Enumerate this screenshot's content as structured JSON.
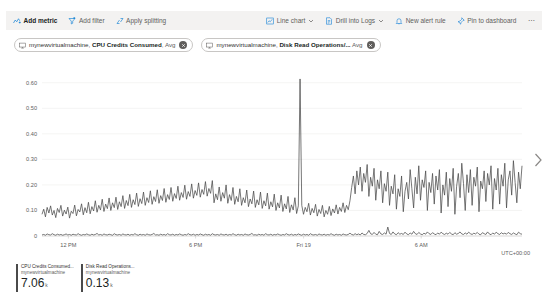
{
  "toolbar": {
    "left_items": [
      {
        "label": "Add metric",
        "icon": "add-metric-icon",
        "primary": true,
        "chevron": false
      },
      {
        "label": "Add filter",
        "icon": "add-filter-icon",
        "primary": false,
        "chevron": false
      },
      {
        "label": "Apply splitting",
        "icon": "apply-splitting-icon",
        "primary": false,
        "chevron": false
      }
    ],
    "right_items": [
      {
        "label": "Line chart",
        "icon": "line-chart-icon",
        "primary": false,
        "chevron": true
      },
      {
        "label": "Drill into Logs",
        "icon": "drill-into-logs-icon",
        "primary": false,
        "chevron": true
      },
      {
        "label": "New alert rule",
        "icon": "new-alert-rule-icon",
        "primary": false,
        "chevron": false
      },
      {
        "label": "Pin to dashboard",
        "icon": "pin-to-dashboard-icon",
        "primary": false,
        "chevron": false
      }
    ],
    "overflow_label": "⋯"
  },
  "metric_pills": [
    {
      "resource": "mynewvirtualmachine,",
      "metric": "CPU Credits Consumed",
      "separator": ",",
      "aggregation": "Avg",
      "icon": "vm-icon",
      "close_icon": "close-icon"
    },
    {
      "resource": "mynewvirtualmachine,",
      "metric": "Disk Read Operations/...",
      "separator": "",
      "aggregation": "Avg",
      "icon": "vm-icon",
      "close_icon": "close-icon"
    }
  ],
  "next_arrow_icon": "chevron-right-icon",
  "legend": [
    {
      "metric": "CPU Credits Consumed...",
      "resource": "mynewvirtualmachine",
      "value": "7.06",
      "unit": "k",
      "color": "#4a4a4a"
    },
    {
      "metric": "Disk Read Operations...",
      "resource": "mynewvirtualmachine",
      "value": "0.13",
      "unit": "k",
      "color": "#4a4a4a"
    }
  ],
  "chart_data": {
    "type": "line",
    "title": "",
    "xlabel": "",
    "ylabel": "",
    "timezone_label": "UTC+00:00",
    "grid": true,
    "legend_position": "bottom",
    "ylim": [
      0,
      0.65
    ],
    "y_ticks": [
      "0",
      "0.10",
      "0.20",
      "0.30",
      "0.40",
      "0.50",
      "0.60"
    ],
    "y_tick_values": [
      0,
      0.1,
      0.2,
      0.3,
      0.4,
      0.5,
      0.6
    ],
    "x_ticks": [
      "12 PM",
      "6 PM",
      "Fri 19",
      "6 AM"
    ],
    "x_tick_positions": [
      0.055,
      0.32,
      0.545,
      0.79
    ],
    "series": [
      {
        "name": "CPU Credits Consumed",
        "resource": "mynewvirtualmachine",
        "color": "#4a4a4a",
        "aggregation": "Avg",
        "values": [
          0.085,
          0.105,
          0.075,
          0.112,
          0.09,
          0.118,
          0.082,
          0.1,
          0.072,
          0.108,
          0.092,
          0.12,
          0.078,
          0.101,
          0.086,
          0.113,
          0.07,
          0.097,
          0.088,
          0.121,
          0.079,
          0.104,
          0.094,
          0.126,
          0.083,
          0.111,
          0.091,
          0.132,
          0.087,
          0.115,
          0.098,
          0.138,
          0.093,
          0.12,
          0.102,
          0.144,
          0.096,
          0.125,
          0.107,
          0.149,
          0.1,
          0.13,
          0.111,
          0.152,
          0.104,
          0.134,
          0.115,
          0.158,
          0.108,
          0.139,
          0.119,
          0.163,
          0.112,
          0.142,
          0.123,
          0.168,
          0.116,
          0.146,
          0.127,
          0.172,
          0.12,
          0.15,
          0.131,
          0.177,
          0.124,
          0.154,
          0.135,
          0.181,
          0.128,
          0.158,
          0.139,
          0.186,
          0.132,
          0.162,
          0.143,
          0.19,
          0.136,
          0.166,
          0.147,
          0.195,
          0.14,
          0.17,
          0.151,
          0.199,
          0.144,
          0.174,
          0.155,
          0.204,
          0.148,
          0.178,
          0.159,
          0.208,
          0.152,
          0.182,
          0.163,
          0.213,
          0.156,
          0.186,
          0.167,
          0.217,
          0.13,
          0.165,
          0.142,
          0.192,
          0.136,
          0.17,
          0.148,
          0.2,
          0.128,
          0.162,
          0.139,
          0.19,
          0.124,
          0.155,
          0.134,
          0.185,
          0.12,
          0.15,
          0.13,
          0.18,
          0.115,
          0.145,
          0.126,
          0.176,
          0.112,
          0.142,
          0.122,
          0.172,
          0.108,
          0.138,
          0.118,
          0.168,
          0.105,
          0.134,
          0.114,
          0.164,
          0.1,
          0.13,
          0.11,
          0.16,
          0.096,
          0.126,
          0.106,
          0.155,
          0.092,
          0.122,
          0.102,
          0.15,
          0.088,
          0.118,
          0.615,
          0.12,
          0.085,
          0.112,
          0.095,
          0.128,
          0.082,
          0.108,
          0.091,
          0.124,
          0.078,
          0.104,
          0.088,
          0.12,
          0.075,
          0.1,
          0.085,
          0.116,
          0.08,
          0.106,
          0.09,
          0.122,
          0.086,
          0.112,
          0.096,
          0.13,
          0.092,
          0.12,
          0.103,
          0.138,
          0.19,
          0.235,
          0.165,
          0.255,
          0.2,
          0.27,
          0.175,
          0.245,
          0.21,
          0.28,
          0.155,
          0.23,
          0.195,
          0.265,
          0.14,
          0.22,
          0.185,
          0.255,
          0.13,
          0.205,
          0.175,
          0.25,
          0.12,
          0.195,
          0.165,
          0.24,
          0.105,
          0.185,
          0.155,
          0.235,
          0.095,
          0.175,
          0.21,
          0.145,
          0.26,
          0.185,
          0.11,
          0.23,
          0.165,
          0.275,
          0.14,
          0.22,
          0.19,
          0.255,
          0.1,
          0.21,
          0.17,
          0.245,
          0.125,
          0.235,
          0.18,
          0.26,
          0.09,
          0.2,
          0.16,
          0.25,
          0.115,
          0.225,
          0.175,
          0.265,
          0.085,
          0.195,
          0.245,
          0.15,
          0.285,
          0.205,
          0.1,
          0.24,
          0.17,
          0.26,
          0.12,
          0.23,
          0.195,
          0.27,
          0.095,
          0.215,
          0.185,
          0.255,
          0.135,
          0.245,
          0.2,
          0.275,
          0.105,
          0.225,
          0.18,
          0.265,
          0.125,
          0.24,
          0.195,
          0.285,
          0.11,
          0.22,
          0.255,
          0.16,
          0.295,
          0.21,
          0.13,
          0.25,
          0.185,
          0.275
        ]
      },
      {
        "name": "Disk Read Operations/Sec",
        "resource": "mynewvirtualmachine",
        "color": "#4a4a4a",
        "aggregation": "Avg",
        "values": [
          0.004,
          0.006,
          0.003,
          0.008,
          0.005,
          0.004,
          0.009,
          0.005,
          0.003,
          0.007,
          0.004,
          0.006,
          0.003,
          0.005,
          0.008,
          0.004,
          0.006,
          0.003,
          0.007,
          0.005,
          0.004,
          0.009,
          0.005,
          0.003,
          0.006,
          0.004,
          0.008,
          0.005,
          0.003,
          0.007,
          0.004,
          0.006,
          0.01,
          0.004,
          0.006,
          0.003,
          0.008,
          0.005,
          0.004,
          0.007,
          0.005,
          0.003,
          0.009,
          0.005,
          0.004,
          0.006,
          0.003,
          0.008,
          0.005,
          0.004,
          0.007,
          0.003,
          0.006,
          0.004,
          0.009,
          0.005,
          0.003,
          0.007,
          0.004,
          0.006,
          0.003,
          0.008,
          0.005,
          0.004,
          0.006,
          0.01,
          0.004,
          0.005,
          0.003,
          0.007,
          0.004,
          0.006,
          0.003,
          0.009,
          0.005,
          0.004,
          0.007,
          0.003,
          0.006,
          0.004,
          0.008,
          0.005,
          0.003,
          0.006,
          0.004,
          0.009,
          0.005,
          0.004,
          0.007,
          0.003,
          0.006,
          0.004,
          0.008,
          0.005,
          0.003,
          0.007,
          0.004,
          0.006,
          0.003,
          0.009,
          0.005,
          0.004,
          0.006,
          0.003,
          0.008,
          0.005,
          0.004,
          0.007,
          0.003,
          0.006,
          0.004,
          0.009,
          0.005,
          0.003,
          0.007,
          0.004,
          0.006,
          0.003,
          0.008,
          0.005,
          0.004,
          0.006,
          0.01,
          0.004,
          0.005,
          0.003,
          0.007,
          0.004,
          0.006,
          0.003,
          0.009,
          0.005,
          0.004,
          0.007,
          0.003,
          0.006,
          0.004,
          0.008,
          0.005,
          0.003,
          0.006,
          0.004,
          0.009,
          0.005,
          0.004,
          0.007,
          0.003,
          0.006,
          0.004,
          0.008,
          0.005,
          0.003,
          0.007,
          0.004,
          0.006,
          0.003,
          0.009,
          0.005,
          0.004,
          0.006,
          0.003,
          0.008,
          0.005,
          0.004,
          0.007,
          0.003,
          0.006,
          0.004,
          0.009,
          0.005,
          0.003,
          0.007,
          0.004,
          0.006,
          0.003,
          0.008,
          0.005,
          0.004,
          0.006,
          0.011,
          0.006,
          0.004,
          0.009,
          0.005,
          0.008,
          0.004,
          0.012,
          0.006,
          0.005,
          0.01,
          0.022,
          0.009,
          0.006,
          0.014,
          0.007,
          0.005,
          0.018,
          0.008,
          0.006,
          0.012,
          0.007,
          0.035,
          0.01,
          0.006,
          0.016,
          0.008,
          0.005,
          0.013,
          0.007,
          0.01,
          0.006,
          0.015,
          0.008,
          0.005,
          0.012,
          0.007,
          0.018,
          0.009,
          0.006,
          0.014,
          0.008,
          0.005,
          0.011,
          0.007,
          0.016,
          0.009,
          0.006,
          0.013,
          0.008,
          0.005,
          0.012,
          0.007,
          0.015,
          0.009,
          0.006,
          0.011,
          0.007,
          0.014,
          0.008,
          0.005,
          0.013,
          0.007,
          0.01,
          0.016,
          0.008,
          0.006,
          0.012,
          0.007,
          0.015,
          0.009,
          0.006,
          0.011,
          0.008,
          0.014,
          0.007,
          0.005,
          0.013,
          0.009,
          0.006,
          0.016,
          0.008,
          0.005,
          0.012,
          0.007,
          0.015,
          0.009,
          0.006,
          0.013,
          0.008,
          0.011,
          0.007,
          0.014,
          0.009,
          0.006,
          0.012,
          0.008,
          0.005,
          0.015,
          0.009,
          0.007
        ]
      }
    ]
  }
}
